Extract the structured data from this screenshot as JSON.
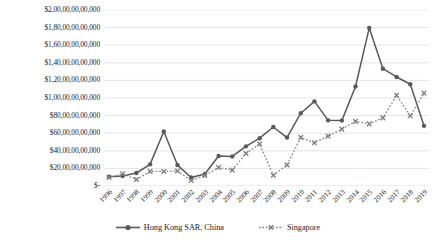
{
  "chart_data": {
    "type": "line",
    "title": "",
    "xlabel": "",
    "ylabel": "",
    "categories": [
      "1996",
      "1997",
      "1998",
      "1999",
      "2000",
      "2001",
      "2002",
      "2003",
      "2004",
      "2005",
      "2006",
      "2007",
      "2008",
      "2009",
      "2010",
      "2011",
      "2012",
      "2013",
      "2014",
      "2015",
      "2016",
      "2017",
      "2018",
      "2019"
    ],
    "ylim": [
      0,
      200000000000
    ],
    "ytick_values": [
      0,
      20000000000,
      40000000000,
      60000000000,
      80000000000,
      100000000000,
      120000000000,
      140000000000,
      160000000000,
      180000000000,
      200000000000
    ],
    "ytick_labels": [
      "$-",
      "$20,00,00,00,000",
      "$40,00,00,00,000",
      "$60,00,00,00,000",
      "$80,00,00,00,000",
      "$1,00,00,00,00,000",
      "$1,20,00,00,00,000",
      "$1,40,00,00,00,000",
      "$1,60,00,00,00,000",
      "$1,80,00,00,00,000",
      "$2,00,00,00,00,000"
    ],
    "grid": true,
    "legend_position": "bottom",
    "series": [
      {
        "name": "Hong Kong SAR, China",
        "color": "#595959",
        "line_style": "solid",
        "marker": "circle",
        "values": [
          10460000000,
          11370000000,
          14770000000,
          24580000000,
          61940000000,
          23780000000,
          9680000000,
          13620000000,
          34030000000,
          33620000000,
          45060000000,
          54340000000,
          67040000000,
          55030000000,
          82710000000,
          96130000000,
          74580000000,
          74290000000,
          113030000000,
          179480000000,
          133270000000,
          123890000000,
          115660000000,
          68380000000
        ]
      },
      {
        "name": "Singapore",
        "color": "#808080",
        "line_style": "dotted",
        "marker": "cross",
        "values": [
          9680000000,
          13750000000,
          7310000000,
          16580000000,
          16480000000,
          17010000000,
          6160000000,
          11940000000,
          21030000000,
          18090000000,
          36920000000,
          47730000000,
          12200000000,
          23820000000,
          55080000000,
          49160000000,
          56660000000,
          64680000000,
          73470000000,
          70550000000,
          77450000000,
          103070000000,
          79740000000,
          105540000000
        ]
      }
    ]
  },
  "legend": {
    "items": [
      {
        "label": "Hong Kong SAR, China",
        "marker": "solid-line-circle-marker"
      },
      {
        "label": "Singapore",
        "marker": "dotted-line-cross-marker"
      }
    ]
  },
  "colors": {
    "hong_kong": "#595959",
    "singapore": "#808080",
    "gridline": "#d9d9d9",
    "text": "#1a1a1a",
    "background": "#ffffff"
  }
}
